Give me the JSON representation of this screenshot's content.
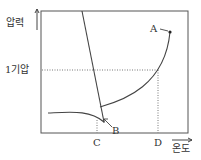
{
  "diagram": {
    "type": "phase-diagram",
    "y_axis_label": "압력",
    "x_axis_label": "온도",
    "pressure_reference_label": "1기압",
    "points": [
      {
        "name": "A",
        "label": "A"
      },
      {
        "name": "B",
        "label": "B"
      }
    ],
    "x_ticks": [
      {
        "name": "C",
        "label": "C"
      },
      {
        "name": "D",
        "label": "D"
      }
    ],
    "colors": {
      "line": "#444444",
      "dotted": "#777777"
    }
  }
}
